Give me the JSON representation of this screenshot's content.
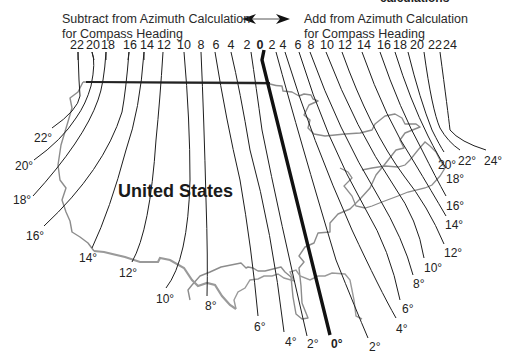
{
  "diagram": {
    "type": "isogonic-declination-map",
    "header": {
      "cut_off_title": "calculations",
      "left_caption_line1": "Subtract from Azimuth Calculation",
      "left_caption_line2": "for Compass Heading",
      "right_caption_line1": "Add from Azimuth Calculation",
      "right_caption_line2": "for Compass Heading",
      "arrow": "double-headed-arrow"
    },
    "top_scale": {
      "west": [
        "22",
        "20",
        "18",
        "16",
        "14",
        "12",
        "10",
        "8",
        "6",
        "4",
        "2"
      ],
      "zero": "0",
      "east": [
        "2",
        "4",
        "6",
        "8",
        "10",
        "12",
        "14",
        "16",
        "18",
        "20",
        "22",
        "24"
      ]
    },
    "map_label": "United States",
    "bottom_labels": {
      "west": [
        {
          "label": "22°",
          "x": 34,
          "y": 131
        },
        {
          "label": "20°",
          "x": 15,
          "y": 165
        },
        {
          "label": "18°",
          "x": 13,
          "y": 200
        },
        {
          "label": "16°",
          "x": 26,
          "y": 229
        },
        {
          "label": "14°",
          "x": 79,
          "y": 251
        },
        {
          "label": "12°",
          "x": 119,
          "y": 266
        },
        {
          "label": "10°",
          "x": 156,
          "y": 292
        },
        {
          "label": "8°",
          "x": 205,
          "y": 299
        },
        {
          "label": "6°",
          "x": 255,
          "y": 320
        },
        {
          "label": "4°",
          "x": 285,
          "y": 335
        },
        {
          "label": "2°",
          "x": 307,
          "y": 337
        }
      ],
      "zero": {
        "label": "0°",
        "x": 331,
        "y": 337
      },
      "east": [
        {
          "label": "2°",
          "x": 369,
          "y": 340
        },
        {
          "label": "4°",
          "x": 396,
          "y": 322
        },
        {
          "label": "6°",
          "x": 402,
          "y": 302
        },
        {
          "label": "8°",
          "x": 413,
          "y": 277
        },
        {
          "label": "10°",
          "x": 424,
          "y": 261
        },
        {
          "label": "12°",
          "x": 444,
          "y": 246
        },
        {
          "label": "14°",
          "x": 445,
          "y": 218
        },
        {
          "label": "16°",
          "x": 446,
          "y": 199
        },
        {
          "label": "18°",
          "x": 446,
          "y": 172
        },
        {
          "label": "20°",
          "x": 438,
          "y": 158
        },
        {
          "label": "22°",
          "x": 458,
          "y": 154
        },
        {
          "label": "24°",
          "x": 484,
          "y": 154
        }
      ]
    },
    "colors": {
      "isogonic_line": "#1e1e1e",
      "agonic_line": "#111111",
      "border": "#8a8a8a",
      "coastline": "#9a9a9a"
    }
  }
}
